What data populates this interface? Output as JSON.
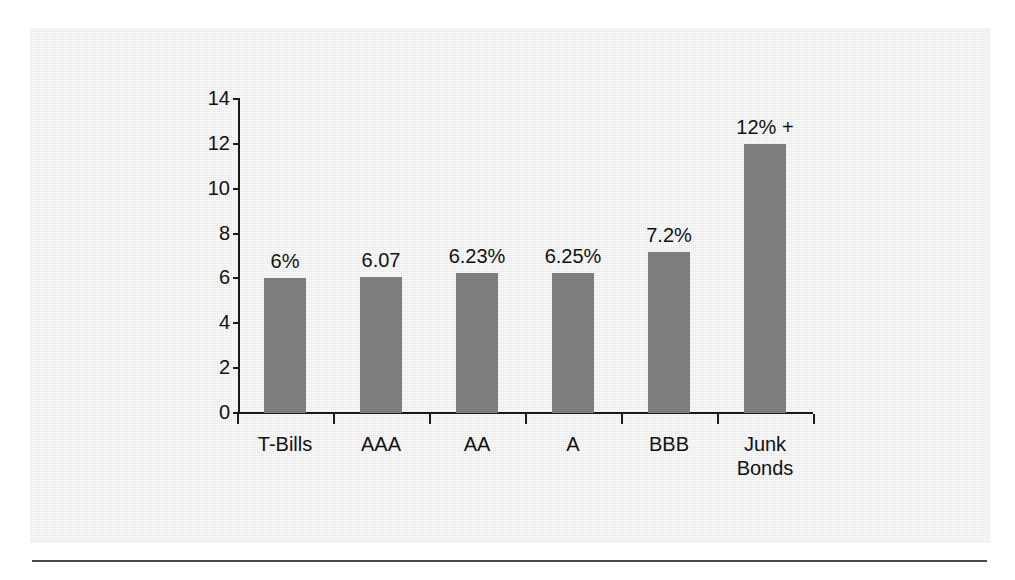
{
  "figure": {
    "background_color": "#eeeeee",
    "bar_color": "#7d7d7d",
    "axis_color": "#1a1a1a",
    "text_color": "#111111"
  },
  "chart_data": {
    "type": "bar",
    "title": "",
    "subtitle": "",
    "xlabel": "",
    "ylabel": "",
    "categories": [
      "T-Bills",
      "AAA",
      "AA",
      "A",
      "BBB",
      "Junk\nBonds"
    ],
    "values": [
      6,
      6.07,
      6.23,
      6.25,
      7.2,
      12
    ],
    "data_labels": [
      "6%",
      "6.07",
      "6.23%",
      "6.25%",
      "7.2%",
      "12% +"
    ],
    "ylim": [
      0,
      14
    ],
    "yticks": [
      0,
      2,
      4,
      6,
      8,
      10,
      12,
      14
    ],
    "ytick_labels": [
      "0",
      "2",
      "4",
      "6",
      "8",
      "10",
      "12",
      "14"
    ],
    "grid": false,
    "legend": null,
    "legend_position": "none",
    "annotations": []
  }
}
